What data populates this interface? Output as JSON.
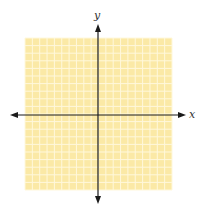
{
  "diagram": {
    "type": "coordinate-plane",
    "grid": {
      "columns": 20,
      "rows": 20,
      "background": "#fbe9a6",
      "line_color": "#fff8dc"
    },
    "axes": {
      "x_label": "x",
      "y_label": "y",
      "color": "#1a1a1a"
    }
  }
}
